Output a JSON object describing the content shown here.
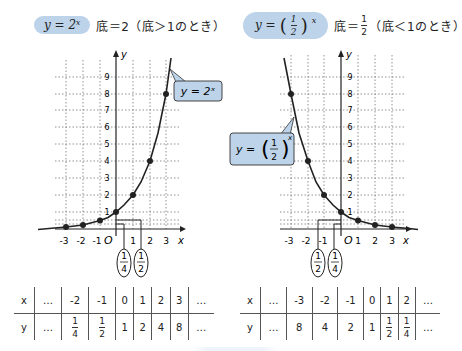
{
  "left": {
    "header": {
      "formula": "y = 2ˣ",
      "condition": "底＝2（底＞1のとき）"
    },
    "callout": "y = 2ˣ",
    "axis": {
      "x_label": "x",
      "y_label": "y",
      "origin": "O"
    },
    "x_ticks": [
      "-3",
      "-2",
      "-1",
      "1",
      "2",
      "3"
    ],
    "y_ticks": [
      "1",
      "2",
      "3",
      "4",
      "5",
      "6",
      "7",
      "8",
      "9"
    ],
    "annotations": [
      {
        "num": "1",
        "den": "4"
      },
      {
        "num": "1",
        "den": "2"
      }
    ],
    "table": {
      "x_row": [
        "x",
        "…",
        "-2",
        "-1",
        "0",
        "1",
        "2",
        "3",
        "…"
      ],
      "y_row": [
        "y",
        "…",
        "1/4",
        "1/2",
        "1",
        "2",
        "4",
        "8",
        "…"
      ]
    }
  },
  "right": {
    "header": {
      "formula_prefix": "y =",
      "formula_num": "1",
      "formula_den": "2",
      "formula_exp": "x",
      "condition_prefix": "底＝",
      "condition_num": "1",
      "condition_den": "2",
      "condition_suffix": "（底＜1のとき）"
    },
    "callout": {
      "prefix": "y =",
      "num": "1",
      "den": "2",
      "exp": "x"
    },
    "axis": {
      "x_label": "x",
      "y_label": "y",
      "origin": "O"
    },
    "x_ticks": [
      "-3",
      "-2",
      "-1",
      "1",
      "2",
      "3"
    ],
    "y_ticks": [
      "1",
      "2",
      "3",
      "4",
      "5",
      "6",
      "7",
      "8",
      "9"
    ],
    "annotations": [
      {
        "num": "1",
        "den": "2"
      },
      {
        "num": "1",
        "den": "4"
      }
    ],
    "table": {
      "x_row": [
        "x",
        "…",
        "-3",
        "-2",
        "-1",
        "0",
        "1",
        "2",
        "…"
      ],
      "y_row": [
        "y",
        "…",
        "8",
        "4",
        "2",
        "1",
        "1/2",
        "1/4",
        "…"
      ]
    }
  },
  "colors": {
    "highlight": "#bcd3ea",
    "curve": "#222222",
    "grid": "#666666"
  },
  "chart_data": [
    {
      "type": "line",
      "title": "y = 2^x（底＝2, 底＞1のとき）",
      "xlabel": "x",
      "ylabel": "y",
      "x": [
        -3,
        -2,
        -1,
        0,
        1,
        2,
        3
      ],
      "series": [
        {
          "name": "y = 2^x",
          "values": [
            0.125,
            0.25,
            0.5,
            1,
            2,
            4,
            8
          ]
        }
      ],
      "xlim": [
        -3.5,
        3.5
      ],
      "ylim": [
        0,
        9.5
      ],
      "grid": true
    },
    {
      "type": "line",
      "title": "y = (1/2)^x（底＝1/2, 底＜1のとき）",
      "xlabel": "x",
      "ylabel": "y",
      "x": [
        -3,
        -2,
        -1,
        0,
        1,
        2,
        3
      ],
      "series": [
        {
          "name": "y = (1/2)^x",
          "values": [
            8,
            4,
            2,
            1,
            0.5,
            0.25,
            0.125
          ]
        }
      ],
      "xlim": [
        -3.5,
        3.5
      ],
      "ylim": [
        0,
        9.5
      ],
      "grid": true
    }
  ]
}
